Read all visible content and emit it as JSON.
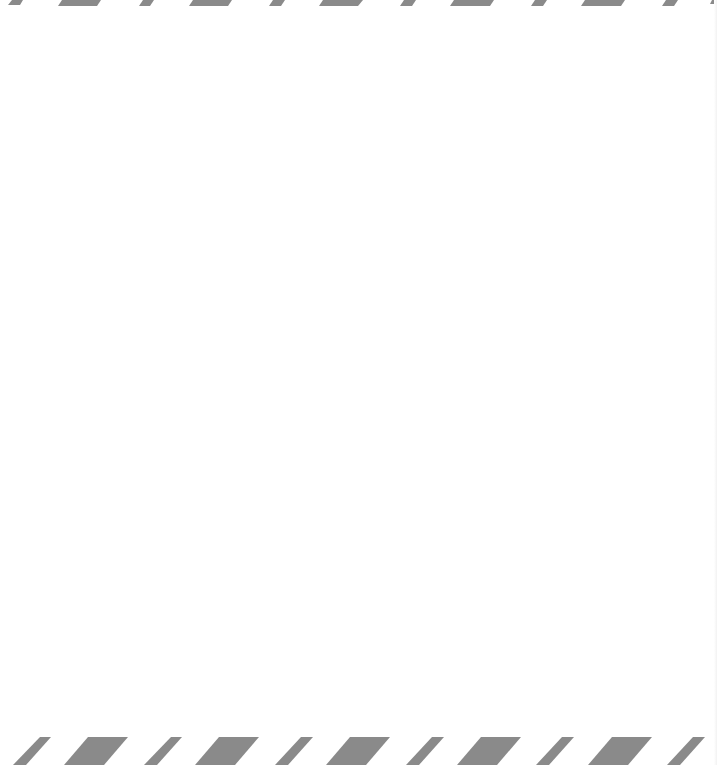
{
  "page": {
    "background_color": "#ffffff",
    "stripe_color": "#8a8a8a"
  },
  "top_border": {
    "pattern": "alternating-diagonal-stripes",
    "stripe_count": 11
  },
  "bottom_border": {
    "pattern": "alternating-diagonal-stripes",
    "stripe_count": 11
  },
  "main": {
    "content": ""
  }
}
